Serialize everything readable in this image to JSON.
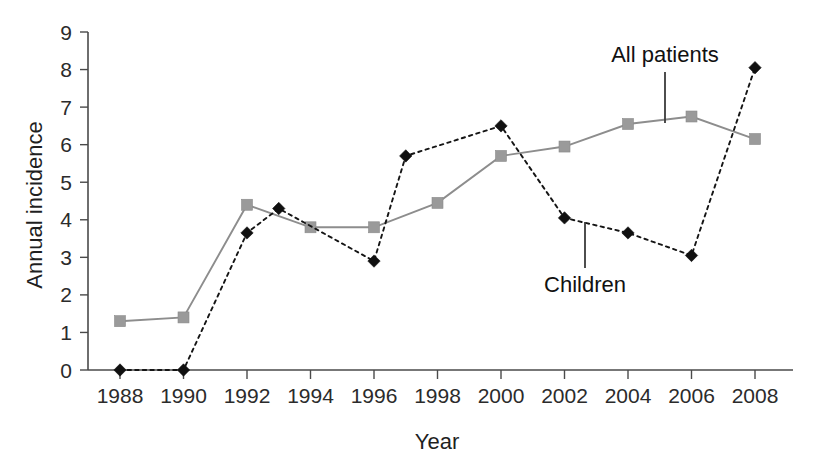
{
  "chart_data": {
    "type": "line",
    "title": "",
    "xlabel": "Year",
    "ylabel": "Annual incidence",
    "xlim": [
      1987,
      2009
    ],
    "ylim": [
      0,
      9
    ],
    "grid": false,
    "legend_position": "inline-annotations",
    "x_ticks": [
      1988,
      1990,
      1992,
      1994,
      1996,
      1998,
      2000,
      2002,
      2004,
      2006,
      2008
    ],
    "y_ticks": [
      0,
      1,
      2,
      3,
      4,
      5,
      6,
      7,
      8,
      9
    ],
    "series": [
      {
        "name": "All patients",
        "style": "solid",
        "color": "#8d8d8d",
        "marker": "square",
        "x": [
          1988,
          1990,
          1992,
          1994,
          1996,
          1998,
          2000,
          2002,
          2004,
          2006,
          2008
        ],
        "values": [
          1.3,
          1.4,
          4.4,
          3.8,
          3.8,
          4.45,
          5.7,
          5.95,
          6.55,
          6.75,
          6.15
        ]
      },
      {
        "name": "Children",
        "style": "dotted",
        "color": "#101010",
        "marker": "diamond",
        "x": [
          1988,
          1990,
          1992,
          1993,
          1996,
          1997,
          2000,
          2002,
          2004,
          2006,
          2008
        ],
        "values": [
          0.0,
          0.0,
          3.65,
          4.3,
          2.9,
          5.7,
          6.5,
          4.05,
          3.65,
          3.05,
          8.05
        ]
      }
    ],
    "annotations": [
      {
        "text": "All patients",
        "target_x": 2005,
        "target_y": 6.65
      },
      {
        "text": "Children",
        "target_x": 2003,
        "target_y": 3.9
      }
    ]
  },
  "labels": {
    "y_axis_title": "Annual incidence",
    "x_axis_title": "Year",
    "series_all_patients": "All patients",
    "series_children": "Children"
  }
}
